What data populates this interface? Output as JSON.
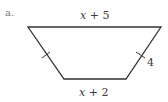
{
  "figure": {
    "part_label": "a.",
    "shape": "isosceles-trapezoid",
    "top_base_label": "x + 5",
    "bottom_base_label": "x + 2",
    "leg_label": "4",
    "stroke_color": "#333333",
    "label_color": "#3a3a3a",
    "vertices": {
      "top_left": [
        28,
        27
      ],
      "top_right": [
        161,
        27
      ],
      "bottom_right": [
        126,
        79
      ],
      "bottom_left": [
        64,
        79
      ]
    },
    "congruence_ticks": [
      "left-leg",
      "right-leg"
    ]
  }
}
